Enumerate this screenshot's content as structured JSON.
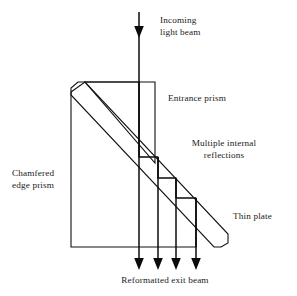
{
  "figure": {
    "background_color": "#ffffff",
    "line_color": "#111111",
    "text_color": "#1a1a1a"
  },
  "labels": {
    "incoming_line1": "Incoming",
    "incoming_line2": "light beam",
    "entrance_prism": "Entrance prism",
    "multiple_line1": "Multiple internal",
    "multiple_line2": "reflections",
    "chamfered_line1": "Chamfered",
    "chamfered_line2": "edge prism",
    "thin_plate": "Thin plate",
    "exit_beam": "Reformatted exit beam"
  },
  "optics": {
    "incoming_beam_count": 1,
    "exit_beam_count": 4,
    "internal_reflection_steps": 3,
    "exit_beam_x_positions": [
      139,
      158,
      176,
      196
    ],
    "incoming_beam_x": 139
  },
  "fills": {
    "entrance_prism_pattern": "fine-dot",
    "chamfered_prism_pattern": "tick-hatch",
    "thin_plate_pattern": "fine-dot"
  }
}
